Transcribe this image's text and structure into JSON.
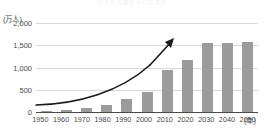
{
  "chart_data": {
    "type": "bar",
    "title": "世界の高齢者人口の推移",
    "categories": [
      "1950",
      "1960",
      "1970",
      "1980",
      "1990",
      "2000",
      "2010",
      "2020",
      "2030",
      "2040",
      "2050"
    ],
    "values": [
      20,
      40,
      85,
      150,
      300,
      450,
      950,
      1180,
      1550,
      1550,
      1570
    ],
    "xlabel": "(年)",
    "ylabel": "(万人)",
    "ylim": [
      0,
      2000
    ],
    "yticks": [
      "0",
      "500",
      "1,000",
      "1,500",
      "2,000"
    ],
    "ytick_values": [
      0,
      500,
      1000,
      1500,
      2000
    ],
    "grid": true,
    "legend": false,
    "series_color": "#9b9b9b",
    "grid_color": "#d8d8d8",
    "axis_color": "#4a4a4a",
    "annotations": [
      {
        "name": "growth-trend-arrow",
        "type": "curved-arrow",
        "color": "#1a1a1a",
        "description": "上向きの曲線矢印"
      }
    ]
  }
}
